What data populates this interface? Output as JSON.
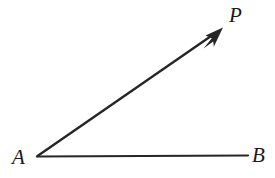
{
  "figure": {
    "width": 275,
    "height": 178,
    "background_color": "#ffffff",
    "stroke_color": "#262626"
  },
  "labels": {
    "vertex": "A",
    "ray_endpoint": "P",
    "segment_endpoint": "B"
  },
  "geometry": {
    "vertex_point": {
      "x": 37,
      "y": 156
    },
    "ray_arrow_tip": {
      "x": 223,
      "y": 28
    },
    "segment_end": {
      "x": 248,
      "y": 156
    },
    "ray_stroke_width": 2.4,
    "segment_stroke_width": 2.2,
    "arrowhead": "solid-barbed-arrow"
  }
}
